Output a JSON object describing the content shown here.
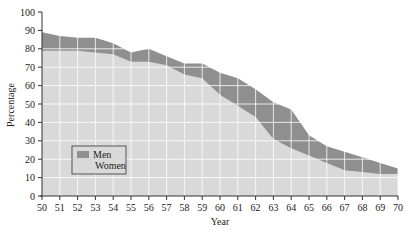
{
  "chart_data": {
    "type": "area",
    "stacked_overlay": true,
    "title": "",
    "xlabel": "Year",
    "ylabel": "Percentage",
    "x": [
      50,
      51,
      52,
      53,
      54,
      55,
      56,
      57,
      58,
      59,
      60,
      61,
      62,
      63,
      64,
      65,
      66,
      67,
      68,
      69,
      70
    ],
    "series": [
      {
        "name": "Men",
        "color": "#8f8f8f",
        "values": [
          89,
          87,
          86,
          86,
          83,
          78,
          80,
          76,
          72,
          72,
          67,
          64,
          58,
          51,
          47,
          33,
          27,
          24,
          21,
          18,
          15
        ]
      },
      {
        "name": "Women",
        "color": "#d9d9d9",
        "values": [
          79,
          79,
          79,
          78,
          77,
          73,
          73,
          71,
          66,
          64,
          55,
          49,
          43,
          31,
          26,
          22,
          18,
          14,
          13,
          12,
          12
        ]
      }
    ],
    "xlim": [
      50,
      70
    ],
    "ylim": [
      0,
      100
    ],
    "yticks": [
      0,
      10,
      20,
      30,
      40,
      50,
      60,
      70,
      80,
      90,
      100
    ],
    "xticks": [
      "50",
      "51",
      "52",
      "53",
      "54",
      "55",
      "56",
      "57",
      "58",
      "59",
      "60",
      "61",
      "62",
      "63",
      "64",
      "65",
      "66",
      "67",
      "68",
      "69",
      "70"
    ],
    "grid": true,
    "grid_color": "#ffffff",
    "legend": {
      "position": "lower-left",
      "entries": [
        "Men",
        "Women"
      ]
    }
  }
}
